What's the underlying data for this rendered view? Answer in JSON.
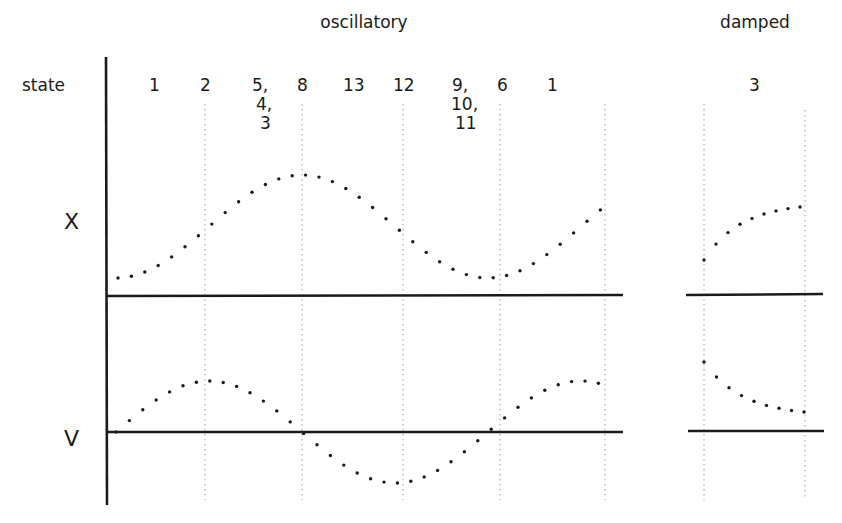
{
  "headings": {
    "oscillatory": "oscillatory",
    "damped": "damped"
  },
  "row_labels": {
    "state": "state",
    "x": "X",
    "v": "V"
  },
  "states": [
    {
      "x": 155,
      "lines": [
        "1"
      ]
    },
    {
      "x": 206,
      "lines": [
        "2"
      ]
    },
    {
      "x": 258,
      "lines": [
        "5,",
        "4,",
        "3"
      ]
    },
    {
      "x": 303,
      "lines": [
        "8"
      ]
    },
    {
      "x": 354,
      "lines": [
        "13"
      ]
    },
    {
      "x": 404,
      "lines": [
        "12"
      ]
    },
    {
      "x": 458,
      "lines": [
        "9,",
        "10,",
        "11"
      ]
    },
    {
      "x": 503,
      "lines": [
        "6"
      ]
    },
    {
      "x": 553,
      "lines": [
        "1"
      ]
    },
    {
      "x": 755,
      "lines": [
        "3"
      ]
    }
  ],
  "colors": {
    "ink": "#1a1a1a",
    "gridline": "#9a9a9a"
  },
  "chart_data": {
    "type": "line",
    "title": "",
    "panels": [
      {
        "name": "oscillatory",
        "state_sequence": [
          "1",
          "2",
          "5,4,3",
          "8",
          "13",
          "12",
          "9,10,11",
          "6",
          "1"
        ],
        "series": [
          {
            "name": "X",
            "style": "dotted",
            "description": "one full cosine-like cycle, rising from a minimum to a maximum near state 8 and back to a minimum near state 6, then rising"
          },
          {
            "name": "V",
            "style": "dotted",
            "description": "sine-like cycle, positive peak near state 2, zero crossing near state 8, negative trough near state 12, zero crossing near state 6, positive at end"
          }
        ]
      },
      {
        "name": "damped",
        "state_sequence": [
          "3"
        ],
        "series": [
          {
            "name": "X",
            "style": "dotted",
            "description": "rising, decelerating curve above baseline"
          },
          {
            "name": "V",
            "style": "dotted",
            "description": "decreasing, flattening curve above baseline"
          }
        ]
      }
    ],
    "ylabels": [
      "X",
      "V"
    ],
    "grid": "vertical dotted lines at state boundaries"
  }
}
